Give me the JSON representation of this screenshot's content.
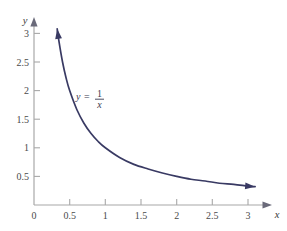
{
  "figure": {
    "background_color": "#ffffff",
    "curve_color": "#393a63",
    "axis_color": "#a8a8a8",
    "tick_label_color": "#4a4a4a",
    "equation_color": "#3a3a4f"
  },
  "axes": {
    "x_axis_name": "x",
    "y_axis_name": "y",
    "origin_label": "0",
    "x_ticks": [
      "0.5",
      "1",
      "1.5",
      "2",
      "2.5",
      "3"
    ],
    "y_ticks": [
      "0.5",
      "1",
      "1.5",
      "2",
      "2.5",
      "3"
    ],
    "x_range": [
      0,
      3.35
    ],
    "y_range": [
      0,
      3.28
    ],
    "x_arrow": true,
    "y_arrow": true
  },
  "annotation": {
    "equation_lhs": "y",
    "equation_equals": "=",
    "equation_numerator": "1",
    "equation_denominator": "x",
    "equation_plain": "y = 1/x"
  },
  "chart_data": {
    "type": "line",
    "title": "",
    "xlabel": "x",
    "ylabel": "y",
    "xlim": [
      0,
      3.35
    ],
    "ylim": [
      0,
      3.28
    ],
    "grid": false,
    "legend": "none",
    "annotations": [
      {
        "text": "y = 1/x",
        "x": 0.78,
        "y": 1.9
      }
    ],
    "series": [
      {
        "name": "y = 1/x",
        "color": "#393a63",
        "start_arrow": true,
        "end_arrow": true,
        "x": [
          0.325,
          0.35,
          0.4,
          0.45,
          0.5,
          0.6,
          0.7,
          0.8,
          0.9,
          1.0,
          1.2,
          1.4,
          1.6,
          1.8,
          2.0,
          2.2,
          2.4,
          2.6,
          2.8,
          3.0,
          3.1
        ],
        "y": [
          3.08,
          2.86,
          2.5,
          2.22,
          2.0,
          1.67,
          1.43,
          1.25,
          1.11,
          1.0,
          0.83,
          0.71,
          0.63,
          0.56,
          0.5,
          0.45,
          0.42,
          0.38,
          0.36,
          0.33,
          0.32
        ]
      }
    ]
  }
}
